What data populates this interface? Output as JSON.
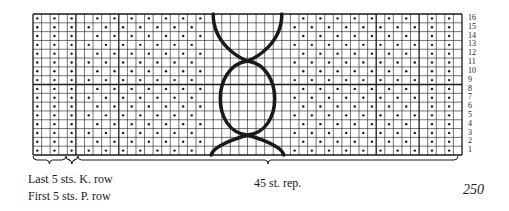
{
  "chart": {
    "columns": 50,
    "rows": 16,
    "row_labels": [
      "16",
      "15",
      "14",
      "13",
      "12",
      "11",
      "10",
      "9",
      "8",
      "7",
      "6",
      "5",
      "4",
      "3",
      "2",
      "1"
    ],
    "symbol_legend": {
      "dot": "purl",
      "blank": "knit"
    },
    "rib_columns_left": [
      1,
      3,
      5
    ],
    "rib_columns_right": [
      47,
      49
    ],
    "cable_columns": {
      "start": 22,
      "end": 29
    },
    "cable_shape": "interlocking circles (wave cable) spanning rows 1-16",
    "ink_color": "#1a1a1a"
  },
  "captions": {
    "last_sts": "Last 5 sts. K. row",
    "first_sts": "First 5 sts. P. row",
    "repeat": "45 st. rep.",
    "page_number": "250"
  }
}
